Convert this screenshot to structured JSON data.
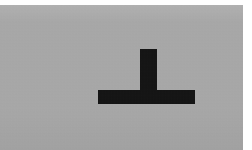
{
  "image": {
    "title": "Perpendicular symbol on gray plate",
    "description": "A photographic gray rectangular plate showing a solid black inverted-T (perpendicular / up-tack) symbol",
    "width": 252,
    "height": 150
  },
  "canvas": {
    "background_color": "#ffffff"
  },
  "plate": {
    "label": "gray background plate",
    "color": "#a9a9a9",
    "left": 0,
    "top": 5,
    "width": 243,
    "height": 145
  },
  "symbol": {
    "name": "perpendicular-symbol",
    "glyph": "⊥",
    "color": "#111111",
    "parts": {
      "stem": {
        "label": "vertical stem",
        "left": 140,
        "top": 49,
        "width": 17,
        "height": 47
      },
      "base": {
        "label": "horizontal base bar",
        "left": 98,
        "top": 90,
        "width": 97,
        "height": 14
      }
    }
  }
}
